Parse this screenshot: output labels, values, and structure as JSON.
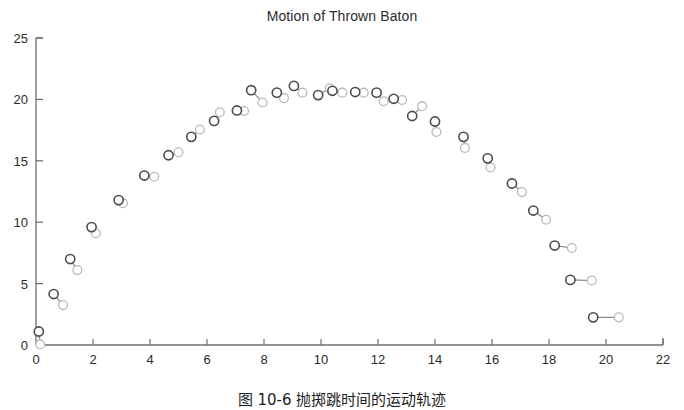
{
  "chart_data": {
    "type": "scatter",
    "title": "Motion of Thrown Baton",
    "xlabel": "",
    "ylabel": "",
    "xlim": [
      0,
      22
    ],
    "ylim": [
      0,
      25
    ],
    "xticks": [
      0,
      2,
      4,
      6,
      8,
      10,
      12,
      14,
      16,
      18,
      20,
      22
    ],
    "yticks": [
      0,
      5,
      10,
      15,
      20,
      25
    ],
    "grid": false,
    "legend": null,
    "series": [
      {
        "name": "baton-end-dark",
        "marker": "open-circle",
        "color": "#4a4a52"
      },
      {
        "name": "baton-end-light",
        "marker": "open-circle",
        "color": "#b9b9bf"
      }
    ],
    "batons": [
      {
        "x1": 0.1,
        "y1": 1.1,
        "x2": 0.15,
        "y2": 0.05
      },
      {
        "x1": 0.62,
        "y1": 4.15,
        "x2": 0.95,
        "y2": 3.25
      },
      {
        "x1": 1.2,
        "y1": 7.0,
        "x2": 1.45,
        "y2": 6.1
      },
      {
        "x1": 1.95,
        "y1": 9.6,
        "x2": 2.1,
        "y2": 9.1
      },
      {
        "x1": 2.9,
        "y1": 11.8,
        "x2": 3.05,
        "y2": 11.55
      },
      {
        "x1": 3.8,
        "y1": 13.8,
        "x2": 4.15,
        "y2": 13.7
      },
      {
        "x1": 4.65,
        "y1": 15.45,
        "x2": 5.0,
        "y2": 15.7
      },
      {
        "x1": 5.45,
        "y1": 16.95,
        "x2": 5.75,
        "y2": 17.55
      },
      {
        "x1": 6.25,
        "y1": 18.25,
        "x2": 6.45,
        "y2": 18.95
      },
      {
        "x1": 7.05,
        "y1": 19.1,
        "x2": 7.3,
        "y2": 19.05
      },
      {
        "x1": 7.55,
        "y1": 20.75,
        "x2": 7.95,
        "y2": 19.75
      },
      {
        "x1": 8.45,
        "y1": 20.55,
        "x2": 8.7,
        "y2": 20.1
      },
      {
        "x1": 9.05,
        "y1": 21.1,
        "x2": 9.35,
        "y2": 20.55
      },
      {
        "x1": 9.9,
        "y1": 20.35,
        "x2": 10.3,
        "y2": 20.9
      },
      {
        "x1": 10.4,
        "y1": 20.7,
        "x2": 10.75,
        "y2": 20.55
      },
      {
        "x1": 11.2,
        "y1": 20.6,
        "x2": 11.5,
        "y2": 20.55
      },
      {
        "x1": 11.95,
        "y1": 20.55,
        "x2": 12.2,
        "y2": 19.85
      },
      {
        "x1": 12.55,
        "y1": 20.05,
        "x2": 12.85,
        "y2": 19.95
      },
      {
        "x1": 13.2,
        "y1": 18.65,
        "x2": 13.55,
        "y2": 19.45
      },
      {
        "x1": 14.0,
        "y1": 18.2,
        "x2": 14.05,
        "y2": 17.35
      },
      {
        "x1": 15.0,
        "y1": 16.95,
        "x2": 15.05,
        "y2": 16.05
      },
      {
        "x1": 15.85,
        "y1": 15.2,
        "x2": 15.95,
        "y2": 14.45
      },
      {
        "x1": 16.7,
        "y1": 13.15,
        "x2": 17.05,
        "y2": 12.45
      },
      {
        "x1": 17.45,
        "y1": 10.95,
        "x2": 17.9,
        "y2": 10.2
      },
      {
        "x1": 18.2,
        "y1": 8.1,
        "x2": 18.8,
        "y2": 7.9
      },
      {
        "x1": 18.75,
        "y1": 5.3,
        "x2": 19.5,
        "y2": 5.25
      },
      {
        "x1": 19.55,
        "y1": 2.25,
        "x2": 20.45,
        "y2": 2.25
      }
    ]
  },
  "caption": {
    "text": "图 10-6  抛掷跳时间的运动轨迹"
  },
  "axes": {
    "x_tick_labels": [
      "0",
      "2",
      "4",
      "6",
      "8",
      "10",
      "12",
      "14",
      "16",
      "18",
      "20",
      "22"
    ],
    "y_tick_labels": [
      "0",
      "5",
      "10",
      "15",
      "20",
      "25"
    ],
    "axis_color": "#6b6b73"
  }
}
